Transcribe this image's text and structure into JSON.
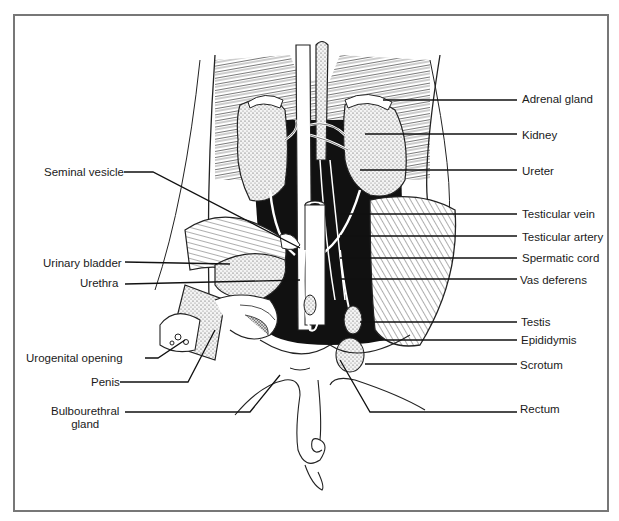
{
  "diagram": {
    "labels_left": [
      {
        "id": "seminal-vesicle",
        "text": "Seminal vesicle",
        "x": 44,
        "y": 166
      },
      {
        "id": "urinary-bladder",
        "text": "Urinary bladder",
        "x": 43,
        "y": 257
      },
      {
        "id": "urethra",
        "text": "Urethra",
        "x": 80,
        "y": 277
      },
      {
        "id": "urogenital-opening",
        "text": "Urogenital opening",
        "x": 26,
        "y": 352
      },
      {
        "id": "penis",
        "text": "Penis",
        "x": 91,
        "y": 376
      },
      {
        "id": "bulbourethral-gland",
        "text": "Bulbourethral\ngland",
        "x": 51,
        "y": 405
      }
    ],
    "labels_right": [
      {
        "id": "adrenal-gland",
        "text": "Adrenal gland",
        "x": 522,
        "y": 93
      },
      {
        "id": "kidney",
        "text": "Kidney",
        "x": 522,
        "y": 129
      },
      {
        "id": "ureter",
        "text": "Ureter",
        "x": 522,
        "y": 165
      },
      {
        "id": "testicular-vein",
        "text": "Testicular vein",
        "x": 522,
        "y": 208
      },
      {
        "id": "testicular-artery",
        "text": "Testicular artery",
        "x": 522,
        "y": 231
      },
      {
        "id": "spermatic-cord",
        "text": "Spermatic cord",
        "x": 522,
        "y": 252
      },
      {
        "id": "vas-deferens",
        "text": "Vas deferens",
        "x": 520,
        "y": 274
      },
      {
        "id": "testis",
        "text": "Testis",
        "x": 521,
        "y": 316
      },
      {
        "id": "epididymis",
        "text": "Epididymis",
        "x": 521,
        "y": 334
      },
      {
        "id": "scrotum",
        "text": "Scrotum",
        "x": 520,
        "y": 359
      },
      {
        "id": "rectum",
        "text": "Rectum",
        "x": 520,
        "y": 403
      }
    ]
  }
}
